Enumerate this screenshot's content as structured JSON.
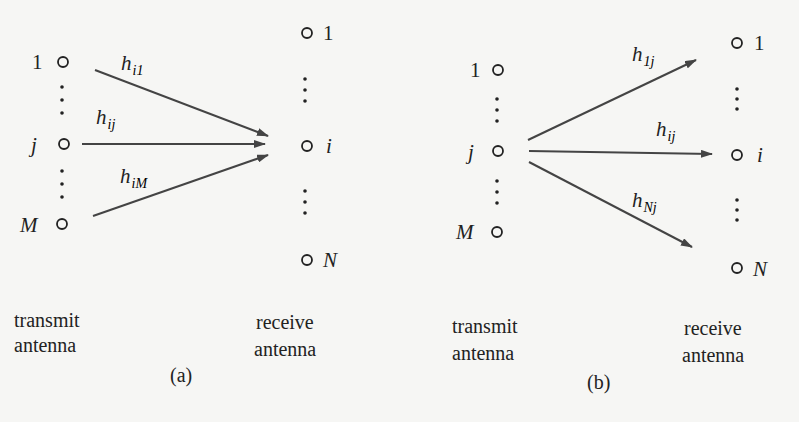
{
  "panel_a": {
    "tag": "(a)",
    "transmit_label": [
      "transmit",
      "antenna"
    ],
    "receive_label": [
      "receive",
      "antenna"
    ],
    "transmit_nodes": {
      "top": "1",
      "middle": "j",
      "bottom": "M"
    },
    "receive_nodes": {
      "top": "1",
      "middle": "i",
      "bottom": "N"
    },
    "edges": [
      {
        "base": "h",
        "sub": "i1"
      },
      {
        "base": "h",
        "sub": "ij"
      },
      {
        "base": "h",
        "sub": "iM"
      }
    ]
  },
  "panel_b": {
    "tag": "(b)",
    "transmit_label": [
      "transmit",
      "antenna"
    ],
    "receive_label": [
      "receive",
      "antenna"
    ],
    "transmit_nodes": {
      "top": "1",
      "middle": "j",
      "bottom": "M"
    },
    "receive_nodes": {
      "top": "1",
      "middle": "i",
      "bottom": "N"
    },
    "edges": [
      {
        "base": "h",
        "sub": "1j"
      },
      {
        "base": "h",
        "sub": "ij"
      },
      {
        "base": "h",
        "sub": "Nj"
      }
    ]
  }
}
